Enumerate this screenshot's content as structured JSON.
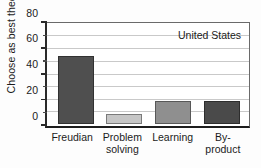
{
  "chart_data": {
    "type": "bar",
    "title": "",
    "subtitle": "",
    "xlabel": "",
    "ylabel": "Choose as best theory (%)",
    "categories": [
      "Freudian",
      "Problem solving",
      "Learning",
      "By-product"
    ],
    "category_lines": [
      [
        "Freudian",
        ""
      ],
      [
        "Problem",
        "solving"
      ],
      [
        "Learning",
        ""
      ],
      [
        "By-",
        "product"
      ]
    ],
    "values": [
      54,
      8,
      18,
      18
    ],
    "bar_colors": [
      "#4f4f4f",
      "#c6c6c6",
      "#8f8f8f",
      "#4a4a4a"
    ],
    "ylim": [
      0,
      80
    ],
    "ytick_labels": [
      "0",
      "20",
      "40",
      "60",
      "80"
    ],
    "ytick_values": [
      0,
      20,
      40,
      60,
      80
    ],
    "yminor_values": [
      10,
      30,
      50,
      70
    ],
    "gridlines": [
      10,
      20,
      30,
      40,
      50,
      60,
      70
    ],
    "grid": true,
    "legend": "none",
    "annotations": [
      {
        "text": "United States",
        "position": "top-right"
      }
    ]
  },
  "annotation": {
    "region_label": "United States"
  }
}
